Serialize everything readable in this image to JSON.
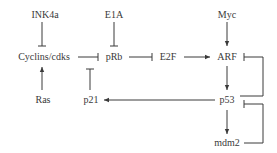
{
  "diagram": {
    "type": "signaling-pathway",
    "nodes": [
      {
        "id": "ink4a",
        "label": "INK4a"
      },
      {
        "id": "e1a",
        "label": "E1A"
      },
      {
        "id": "myc",
        "label": "Myc"
      },
      {
        "id": "cyclins",
        "label": "Cyclins/cdks"
      },
      {
        "id": "prb",
        "label": "pRb"
      },
      {
        "id": "e2f",
        "label": "E2F"
      },
      {
        "id": "arf",
        "label": "ARF"
      },
      {
        "id": "ras",
        "label": "Ras"
      },
      {
        "id": "p21",
        "label": "p21"
      },
      {
        "id": "p53",
        "label": "p53"
      },
      {
        "id": "mdm2",
        "label": "mdm2"
      }
    ],
    "edges": [
      {
        "from": "INK4a",
        "to": "Cyclins/cdks",
        "type": "inhibition"
      },
      {
        "from": "E1A",
        "to": "pRb",
        "type": "inhibition"
      },
      {
        "from": "Myc",
        "to": "ARF",
        "type": "activation"
      },
      {
        "from": "Ras",
        "to": "Cyclins/cdks",
        "type": "activation"
      },
      {
        "from": "Cyclins/cdks",
        "to": "pRb",
        "type": "inhibition"
      },
      {
        "from": "p21",
        "to": "pRb-edge",
        "type": "inhibition"
      },
      {
        "from": "pRb",
        "to": "E2F",
        "type": "inhibition"
      },
      {
        "from": "E2F",
        "to": "ARF",
        "type": "activation"
      },
      {
        "from": "ARF",
        "to": "p53",
        "type": "activation"
      },
      {
        "from": "p53",
        "to": "ARF",
        "type": "inhibition"
      },
      {
        "from": "p53",
        "to": "p21",
        "type": "activation"
      },
      {
        "from": "p53",
        "to": "mdm2",
        "type": "activation"
      },
      {
        "from": "mdm2",
        "to": "p53",
        "type": "inhibition"
      }
    ],
    "colors": {
      "line": "#3a3a3a",
      "text": "#3a3a3a",
      "background": "#ffffff"
    }
  }
}
